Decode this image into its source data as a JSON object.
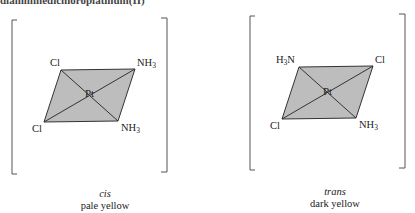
{
  "header": {
    "partial_text": "diamminedichloroplatinum(II)"
  },
  "isomers": [
    {
      "name": "cis",
      "color": "pale yellow",
      "center": "Pt",
      "ligands": {
        "top_left": "Cl",
        "top_right": "NH3",
        "bottom_left": "Cl",
        "bottom_right": "NH3"
      }
    },
    {
      "name": "trans",
      "color": "dark yellow",
      "center": "Pt",
      "ligands": {
        "top_left": "H3N",
        "top_right": "Cl",
        "bottom_left": "Cl",
        "bottom_right": "NH3"
      }
    }
  ],
  "labels": {
    "cis_tl": "Cl",
    "cis_tr_main": "NH",
    "cis_tr_sub": "3",
    "cis_bl": "Cl",
    "cis_br_main": "NH",
    "cis_br_sub": "3",
    "cis_center": "Pt",
    "trans_tl_h": "H",
    "trans_tl_sub": "3",
    "trans_tl_n": "N",
    "trans_tr": "Cl",
    "trans_bl": "Cl",
    "trans_br_main": "NH",
    "trans_br_sub": "3",
    "trans_center": "Pt"
  },
  "colors": {
    "plane_fill": "#bdbdbd",
    "line": "#333333"
  }
}
